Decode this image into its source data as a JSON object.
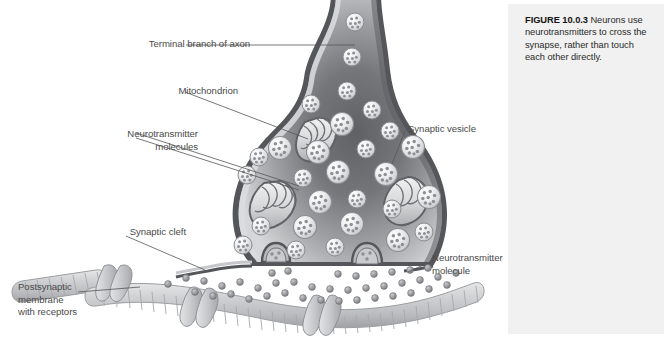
{
  "figure": {
    "number": "FIGURE 10.0.3",
    "caption": " Neurons use neurotransmitters to cross the synapse, rather than touch each other directly."
  },
  "diagram": {
    "labels": [
      {
        "id": "terminal-branch-of-axon",
        "text": "Terminal branch of axon"
      },
      {
        "id": "mitochondrion",
        "text": "Mitochondrion"
      },
      {
        "id": "neurotransmitter-molecules",
        "text": "Neurotransmitter\nmolecules"
      },
      {
        "id": "synaptic-vesicle",
        "text": "Synaptic vesicle"
      },
      {
        "id": "synaptic-cleft",
        "text": "Synaptic cleft"
      },
      {
        "id": "neurotransmitter-molecule",
        "text": "Neurotransmitter\nmolecule"
      },
      {
        "id": "postsynaptic-membrane-with-receptors",
        "text": "Postsynaptic\nmembrane\nwith receptors"
      }
    ],
    "colors": {
      "page_background": "#ffffff",
      "caption_panel": "#f1f1f1",
      "label_text": "#4a4a4a",
      "caption_text": "#2a2a2a",
      "leader_line": "#555555",
      "membrane_outline": "#55565a",
      "cytoplasm_light": "#cfd0d2",
      "cytoplasm_dark": "#6e7074",
      "vesicle_fill": "#e8e9ea",
      "vesicle_outline": "#8a8c90",
      "granule": "#8e9094",
      "postsynaptic_membrane": "#c9cbcd",
      "receptor": "#b4b6b9"
    }
  }
}
